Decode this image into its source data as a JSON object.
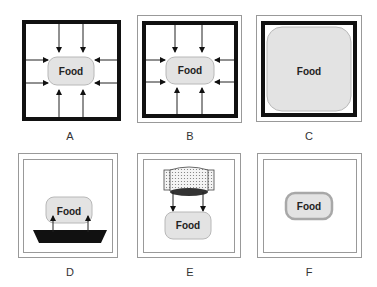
{
  "panels": [
    {
      "id": "A",
      "label": "A",
      "food": "Food",
      "description": "Food centered in box with thick black border, 8 arrows pointing inward from all sides"
    },
    {
      "id": "B",
      "label": "B",
      "food": "Food",
      "description": "Same as A with thin outer frame, 8 arrows pointing inward"
    },
    {
      "id": "C",
      "label": "C",
      "food": "Food",
      "description": "Food fills entire box with thick border and thin outer frame"
    },
    {
      "id": "D",
      "label": "D",
      "food": "Food",
      "description": "Food resting on black trapezoid heat source, two arrows pointing up"
    },
    {
      "id": "E",
      "label": "E",
      "food": "Food",
      "description": "Dotted cylindrical heating element above food, two arrows pointing down"
    },
    {
      "id": "F",
      "label": "F",
      "food": "Food",
      "description": "Food with thick gray outline alone in double-framed box"
    }
  ],
  "colors": {
    "food_fill": "#e3e3e3",
    "food_stroke": "#b5b5b5",
    "border": "#111111",
    "frame": "#888888"
  }
}
